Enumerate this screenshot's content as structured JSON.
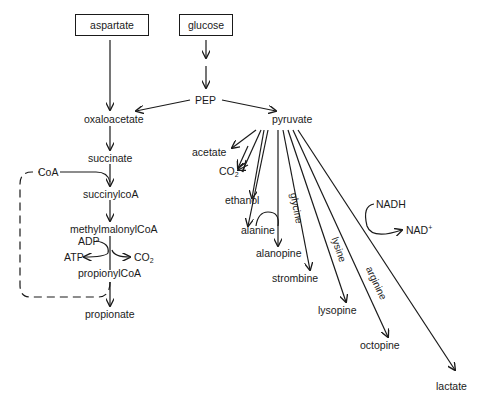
{
  "diagram": {
    "title": "",
    "sources": [
      {
        "id": "aspartate",
        "label": "aspartate",
        "boxed": true
      },
      {
        "id": "glucose",
        "label": "glucose",
        "boxed": true
      }
    ],
    "nodes": {
      "pep": "PEP",
      "oxaloacetate": "oxaloacetate",
      "pyruvate": "pyruvate",
      "succinate": "succinate",
      "succinylcoa": "succinylcoA",
      "methylmalonylcoa": "methylmalonylCoA",
      "propionylcoa": "propionylCoA",
      "propionate": "propionate",
      "coa": "CoA",
      "adp": "ADP",
      "atp": "ATP",
      "co2_left": "CO",
      "co2_left_sub": "2",
      "acetate": "acetate",
      "co2_right": "CO",
      "co2_right_sub": "2",
      "ethanol": "ethanol",
      "alanine": "alanine",
      "alanopine": "alanopine",
      "strombine": "strombine",
      "lysopine": "lysopine",
      "octopine": "octopine",
      "lactate": "lactate",
      "nadh": "NADH",
      "nad": "NAD",
      "nad_sup": "+"
    },
    "edge_labels": {
      "glycine": "glycine",
      "lysine": "lysine",
      "arginine": "arginine"
    },
    "edges": [
      {
        "from": "aspartate",
        "to": "oxaloacetate"
      },
      {
        "from": "glucose",
        "to": "PEP"
      },
      {
        "from": "PEP",
        "to": "oxaloacetate"
      },
      {
        "from": "PEP",
        "to": "pyruvate"
      },
      {
        "from": "oxaloacetate",
        "to": "succinate"
      },
      {
        "from": "succinate",
        "to": "succinylcoA",
        "cofactor": "CoA"
      },
      {
        "from": "succinylcoA",
        "to": "methylmalonylCoA"
      },
      {
        "from": "methylmalonylCoA",
        "to": "propionylCoA",
        "cofactors": [
          "ADP→ATP",
          "CO2"
        ]
      },
      {
        "from": "propionylCoA",
        "to": "propionate",
        "recycle": "CoA (dashed)"
      },
      {
        "from": "pyruvate",
        "to": "acetate"
      },
      {
        "from": "pyruvate",
        "to": "CO2"
      },
      {
        "from": "pyruvate",
        "to": "ethanol"
      },
      {
        "from": "pyruvate",
        "to": "alanine"
      },
      {
        "from": "pyruvate",
        "to": "alanopine",
        "with": "alanine"
      },
      {
        "from": "pyruvate",
        "to": "strombine",
        "with": "glycine"
      },
      {
        "from": "pyruvate",
        "to": "lysopine",
        "with": "lysine"
      },
      {
        "from": "pyruvate",
        "to": "octopine",
        "with": "arginine"
      },
      {
        "from": "pyruvate",
        "to": "lactate",
        "cofactor": "NADH→NAD+"
      }
    ],
    "colors": {
      "ink": "#1a1a1a",
      "background": "#ffffff"
    }
  }
}
